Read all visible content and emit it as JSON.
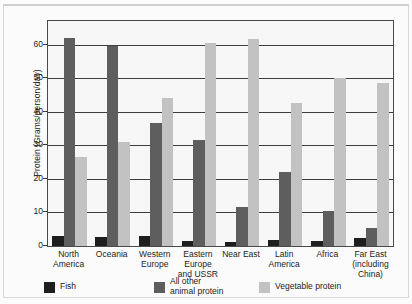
{
  "chart_data": {
    "type": "bar",
    "title": "",
    "xlabel": "",
    "ylabel": "Protein (Grams/person/day)",
    "ylim": [
      0,
      67
    ],
    "yticks": [
      0,
      10,
      20,
      30,
      40,
      50,
      60
    ],
    "ytick_labels": [
      "0",
      "10",
      "20",
      "30",
      "40",
      "50",
      "60"
    ],
    "grid": true,
    "legend_position": "bottom",
    "categories": [
      "North America",
      "Oceania",
      "Western Europe",
      "Eastern Europe and USSR",
      "Near East",
      "Latin America",
      "Africa",
      "Far East (including China)"
    ],
    "category_label_lines": [
      [
        "North",
        "America"
      ],
      [
        "Oceania"
      ],
      [
        "Western",
        "Europe"
      ],
      [
        "Eastern",
        "Europe",
        "and USSR"
      ],
      [
        "Near East"
      ],
      [
        "Latin",
        "America"
      ],
      [
        "Africa"
      ],
      [
        "Far East",
        "(including",
        "China)"
      ]
    ],
    "series": [
      {
        "name": "Fish",
        "legend_label": "Fish",
        "color": "#1e1e1e",
        "values": [
          3.0,
          2.8,
          3.0,
          1.6,
          1.3,
          1.8,
          1.4,
          2.4
        ]
      },
      {
        "name": "All other animal protein",
        "legend_label": "All other\nanimal protein",
        "color": "#5e5e5e",
        "values": [
          62.0,
          59.5,
          36.5,
          31.5,
          11.5,
          22.0,
          10.5,
          5.5
        ]
      },
      {
        "name": "Vegetable protein",
        "legend_label": "Vegetable protein",
        "color": "#c2c2c2",
        "values": [
          26.5,
          31.0,
          44.0,
          60.5,
          61.5,
          42.5,
          50.0,
          48.5
        ]
      }
    ]
  }
}
